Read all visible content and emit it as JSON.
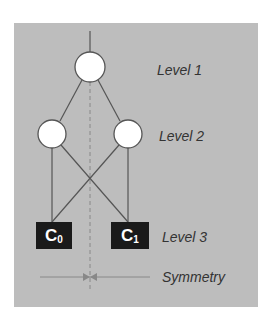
{
  "diagram": {
    "levels": [
      {
        "label": "Level 1"
      },
      {
        "label": "Level 2"
      },
      {
        "label": "Level 3"
      }
    ],
    "leaves": [
      {
        "base": "C",
        "sub": "0"
      },
      {
        "base": "C",
        "sub": "1"
      }
    ],
    "symmetry_label": "Symmetry",
    "colors": {
      "panel": "#bdbdbd",
      "node_fill": "#ffffff",
      "node_stroke": "#555555",
      "leaf_fill": "#1a1a1a",
      "edge": "#555555"
    }
  }
}
